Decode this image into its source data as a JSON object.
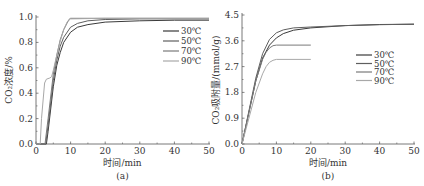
{
  "chart_data": [
    {
      "id": "a",
      "type": "line",
      "subtitle": "(a)",
      "xlabel": "时间/min",
      "ylabel": "CO₂浓度/%",
      "xlim": [
        0,
        50
      ],
      "ylim": [
        0,
        1.0
      ],
      "xticks": [
        0,
        10,
        20,
        30,
        40,
        50
      ],
      "yticks": [
        "0.0",
        "0.2",
        "0.4",
        "0.6",
        "0.8",
        "1.0"
      ],
      "grid": false,
      "legend_position": "upper right",
      "series": [
        {
          "name": "30℃",
          "color": "#3a3a3a",
          "points": [
            [
              0,
              0
            ],
            [
              3,
              0
            ],
            [
              3.5,
              0.1
            ],
            [
              5,
              0.45
            ],
            [
              6,
              0.62
            ],
            [
              7,
              0.72
            ],
            [
              8,
              0.8
            ],
            [
              10,
              0.88
            ],
            [
              12,
              0.92
            ],
            [
              15,
              0.94
            ],
            [
              20,
              0.96
            ],
            [
              30,
              0.97
            ],
            [
              40,
              0.975
            ],
            [
              50,
              0.975
            ]
          ]
        },
        {
          "name": "50℃",
          "color": "#5e5e5e",
          "points": [
            [
              0,
              0
            ],
            [
              2.8,
              0
            ],
            [
              3.5,
              0.15
            ],
            [
              5,
              0.5
            ],
            [
              6,
              0.66
            ],
            [
              7,
              0.77
            ],
            [
              8,
              0.84
            ],
            [
              10,
              0.92
            ],
            [
              12,
              0.95
            ],
            [
              15,
              0.97
            ],
            [
              20,
              0.98
            ],
            [
              30,
              0.985
            ],
            [
              50,
              0.985
            ]
          ]
        },
        {
          "name": "70℃",
          "color": "#7a7a7a",
          "points": [
            [
              0,
              0
            ],
            [
              2.6,
              0
            ],
            [
              3.5,
              0.2
            ],
            [
              5,
              0.55
            ],
            [
              6,
              0.7
            ],
            [
              7,
              0.82
            ],
            [
              8,
              0.9
            ],
            [
              9.5,
              0.98
            ],
            [
              10,
              0.99
            ],
            [
              20,
              0.99
            ],
            [
              50,
              0.99
            ]
          ]
        },
        {
          "name": "90℃",
          "color": "#a8a8a8",
          "points": [
            [
              0,
              0
            ],
            [
              1.2,
              0
            ],
            [
              1.6,
              0.2
            ],
            [
              2.5,
              0.48
            ],
            [
              3,
              0.51
            ],
            [
              4,
              0.52
            ],
            [
              4.5,
              0.53
            ],
            [
              5,
              0.58
            ],
            [
              6,
              0.7
            ],
            [
              7,
              0.81
            ],
            [
              8,
              0.9
            ],
            [
              9,
              0.96
            ],
            [
              10,
              0.985
            ],
            [
              20,
              0.99
            ],
            [
              50,
              0.99
            ]
          ]
        }
      ]
    },
    {
      "id": "b",
      "type": "line",
      "subtitle": "(b)",
      "xlabel": "时间/min",
      "ylabel": "CO₂吸附量/(mmol/g)",
      "xlim": [
        0,
        50
      ],
      "ylim": [
        0,
        4.5
      ],
      "xticks": [
        0,
        10,
        20,
        30,
        40,
        50
      ],
      "yticks": [
        "0.0",
        "0.9",
        "1.8",
        "2.7",
        "3.6",
        "4.5"
      ],
      "grid": false,
      "legend_position": "center right",
      "series": [
        {
          "name": "30℃",
          "color": "#3a3a3a",
          "points": [
            [
              0,
              0
            ],
            [
              2,
              1.1
            ],
            [
              4,
              2.2
            ],
            [
              6,
              3.0
            ],
            [
              8,
              3.45
            ],
            [
              10,
              3.7
            ],
            [
              12,
              3.85
            ],
            [
              15,
              3.97
            ],
            [
              20,
              4.05
            ],
            [
              30,
              4.13
            ],
            [
              40,
              4.17
            ],
            [
              50,
              4.18
            ]
          ]
        },
        {
          "name": "50℃",
          "color": "#5e5e5e",
          "points": [
            [
              0,
              0
            ],
            [
              2,
              1.15
            ],
            [
              4,
              2.3
            ],
            [
              6,
              3.15
            ],
            [
              8,
              3.65
            ],
            [
              10,
              3.88
            ],
            [
              12,
              3.98
            ],
            [
              15,
              4.05
            ],
            [
              20,
              4.08
            ],
            [
              30,
              4.13
            ],
            [
              40,
              4.16
            ],
            [
              50,
              4.18
            ]
          ]
        },
        {
          "name": "70℃",
          "color": "#7a7a7a",
          "points": [
            [
              0,
              0
            ],
            [
              2,
              1.1
            ],
            [
              4,
              2.2
            ],
            [
              6,
              2.95
            ],
            [
              7,
              3.2
            ],
            [
              8,
              3.35
            ],
            [
              9,
              3.43
            ],
            [
              10,
              3.45
            ],
            [
              20,
              3.45
            ]
          ]
        },
        {
          "name": "90℃",
          "color": "#a8a8a8",
          "points": [
            [
              0,
              0
            ],
            [
              2,
              0.9
            ],
            [
              4,
              1.8
            ],
            [
              6,
              2.45
            ],
            [
              7,
              2.7
            ],
            [
              8,
              2.85
            ],
            [
              9,
              2.92
            ],
            [
              10,
              2.95
            ],
            [
              20,
              2.95
            ]
          ]
        }
      ]
    }
  ]
}
